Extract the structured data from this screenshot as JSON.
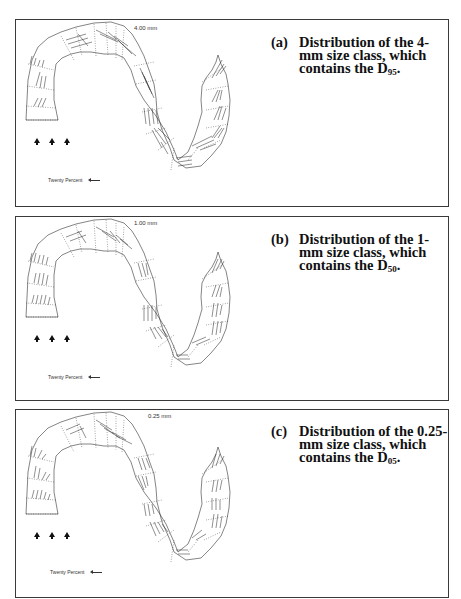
{
  "figure": {
    "panels": [
      {
        "id": "a",
        "tag": "(a)",
        "size_label": "4.00 mm",
        "caption_main": "Distribution of the 4-mm size class, which contains the D",
        "caption_sub": "95",
        "caption_end": ".",
        "legend_label": "Twenty Percent",
        "flow_arrows": 3
      },
      {
        "id": "b",
        "tag": "(b)",
        "size_label": "1.00 mm",
        "caption_main": "Distribution of the 1-mm size class, which contains the D",
        "caption_sub": "50",
        "caption_end": ".",
        "legend_label": "Twenty Percent",
        "flow_arrows": 3
      },
      {
        "id": "c",
        "tag": "(c)",
        "size_label": "0.25 mm",
        "caption_main": "Distribution of the 0.25-mm size class, which contains the D",
        "caption_sub": "05",
        "caption_end": ".",
        "legend_label": "Twenty Percent",
        "flow_arrows": 3
      }
    ],
    "colors": {
      "outline": "#333333",
      "vectors": "#222222",
      "text": "#111111"
    },
    "icons": {
      "flow_direction": "upward-arrow-icon",
      "scale_vector": "left-arrow-icon"
    }
  }
}
